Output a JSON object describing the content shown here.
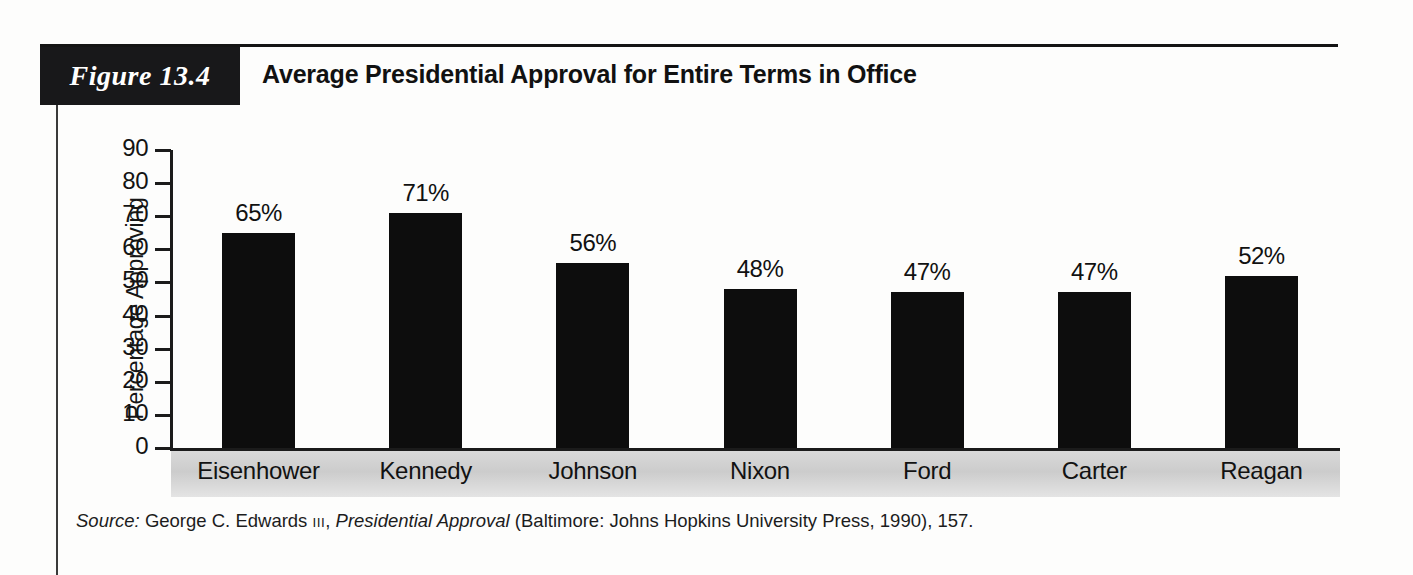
{
  "figure": {
    "badge": "Figure 13.4",
    "title": "Average Presidential Approval for Entire Terms in Office"
  },
  "source": {
    "label": "Source:",
    "author": " George C. Edwards ",
    "author_suffix": "III",
    "separator": ", ",
    "work": "Presidential Approval",
    "publication": " (Baltimore: Johns Hopkins University Press, 1990), 157."
  },
  "chart_data": {
    "type": "bar",
    "title": "Average Presidential Approval for Entire Terms in Office",
    "xlabel": "",
    "ylabel": "Percentage Approving",
    "categories": [
      "Eisenhower",
      "Kennedy",
      "Johnson",
      "Nixon",
      "Ford",
      "Carter",
      "Reagan"
    ],
    "values": [
      65,
      71,
      56,
      48,
      47,
      47,
      52
    ],
    "value_labels": [
      "65%",
      "71%",
      "56%",
      "48%",
      "47%",
      "47%",
      "52%"
    ],
    "ylim": [
      0,
      90
    ],
    "yticks": [
      0,
      10,
      20,
      30,
      40,
      50,
      60,
      70,
      80,
      90
    ],
    "ytick_labels": [
      "0",
      "10",
      "20",
      "30",
      "40",
      "50",
      "60",
      "70",
      "80",
      "90"
    ],
    "grid": false,
    "legend": "none",
    "bar_color": "#0d0d0d",
    "background_color": "#fdfdfc"
  }
}
